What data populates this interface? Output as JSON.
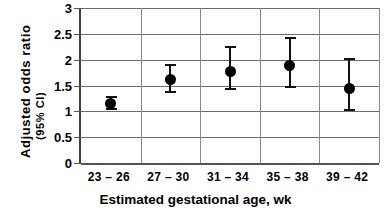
{
  "chart_data": {
    "type": "scatter",
    "title": "",
    "xlabel": "Estimated gestational age, wk",
    "ylabel": "Adjusted odds  ratio",
    "ylabel_line2": "(95% CI)",
    "categories": [
      "23 – 26",
      "27 – 30",
      "31 – 34",
      "35 – 38",
      "39 – 42"
    ],
    "values": [
      1.15,
      1.62,
      1.78,
      1.89,
      1.45
    ],
    "ci_low": [
      1.02,
      1.35,
      1.42,
      1.46,
      1.01
    ],
    "ci_high": [
      1.3,
      1.92,
      2.26,
      2.44,
      2.04
    ],
    "ylim": [
      0,
      3
    ],
    "yticks": [
      0,
      0.5,
      1,
      1.5,
      2,
      2.5,
      3
    ],
    "ytick_labels": [
      "0",
      "0.5",
      "1",
      "1.5",
      "2",
      "2.5",
      "3"
    ],
    "grid": "horizontal-and-vertical",
    "legend": "none",
    "marker_color": "#000000",
    "grid_color": "#6e6e6e",
    "axis_color": "#404040",
    "background": "#ffffff"
  }
}
